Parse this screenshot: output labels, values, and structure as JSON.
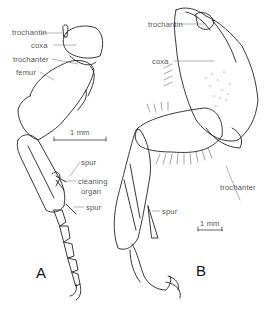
{
  "figure": {
    "panels": [
      {
        "id": "A",
        "label": "A",
        "labels": {
          "trochantin": "trochantin",
          "coxa": "coxa",
          "trochanter": "trochanter",
          "femur": "femur",
          "spur_upper": "spur",
          "cleaning_organ_line1": "cleaning",
          "cleaning_organ_line2": "organ",
          "spur_lower": "spur"
        },
        "scale_bar": "1 mm"
      },
      {
        "id": "B",
        "label": "B",
        "labels": {
          "trochantin": "trochantin",
          "coxa": "coxa",
          "trochanter": "trochanter",
          "spur": "spur"
        },
        "scale_bar": "1 mm"
      }
    ],
    "colors": {
      "ink": "#222222",
      "label_text": "#555555",
      "background": "#ffffff"
    }
  }
}
